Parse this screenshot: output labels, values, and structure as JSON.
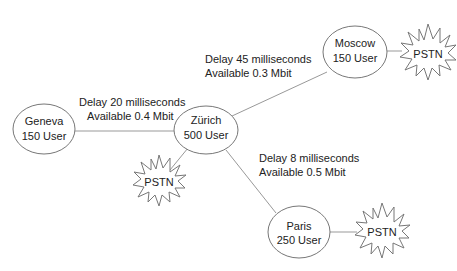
{
  "diagram": {
    "nodes": [
      {
        "id": "geneva",
        "name": "Geneva",
        "users": "150 User"
      },
      {
        "id": "zurich",
        "name": "Zürich",
        "users": "500 User"
      },
      {
        "id": "moscow",
        "name": "Moscow",
        "users": "150 User"
      },
      {
        "id": "paris",
        "name": "Paris",
        "users": "250 User"
      }
    ],
    "links": [
      {
        "from": "geneva",
        "to": "zurich",
        "delay": "Delay 20 milliseconds",
        "available": "Available 0.4 Mbit"
      },
      {
        "from": "zurich",
        "to": "moscow",
        "delay": "Delay 45 milliseconds",
        "available": "Available 0.3 Mbit"
      },
      {
        "from": "zurich",
        "to": "paris",
        "delay": "Delay 8 milliseconds",
        "available": "Available 0.5 Mbit"
      }
    ],
    "pstn": [
      {
        "attached_to": "moscow",
        "label": "PSTN"
      },
      {
        "attached_to": "zurich",
        "label": "PSTN"
      },
      {
        "attached_to": "paris",
        "label": "PSTN"
      }
    ],
    "colors": {
      "stroke": "#777777",
      "line": "#999999",
      "text": "#222222"
    }
  }
}
